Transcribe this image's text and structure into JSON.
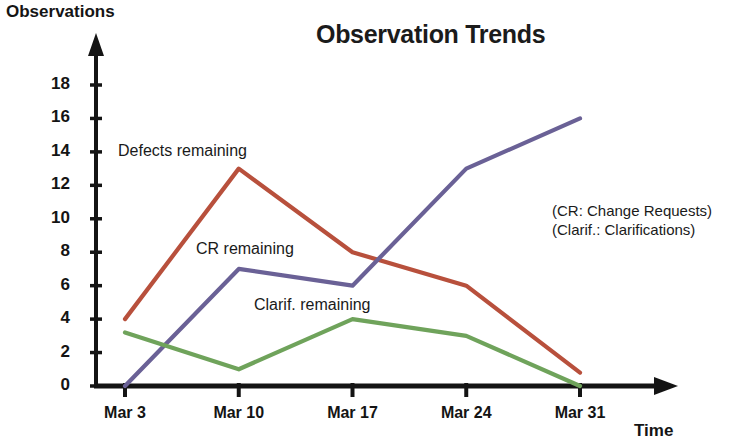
{
  "chart_data": {
    "type": "line",
    "title": "Observation Trends",
    "xlabel": "Time",
    "ylabel": "Observations",
    "categories": [
      "Mar 3",
      "Mar 10",
      "Mar 17",
      "Mar 24",
      "Mar 31"
    ],
    "ylim": [
      0,
      18
    ],
    "y_ticks": [
      "0",
      "2",
      "4",
      "6",
      "8",
      "10",
      "12",
      "14",
      "16",
      "18"
    ],
    "y_tick_values": [
      0,
      2,
      4,
      6,
      8,
      10,
      12,
      14,
      16,
      18
    ],
    "grid": false,
    "legend_position": "inline-labels",
    "series": [
      {
        "name": "Defects remaining",
        "color": "#b8503c",
        "values": [
          4,
          13,
          8,
          6,
          0.8
        ]
      },
      {
        "name": "CR remaining",
        "color": "#6a6196",
        "values": [
          0,
          7,
          6,
          13,
          16
        ]
      },
      {
        "name": "Clarif. remaining",
        "color": "#6fa35b",
        "values": [
          3.2,
          1,
          4,
          3,
          0
        ]
      }
    ],
    "annotations": [
      "(CR: Change Requests)",
      "(Clarif.: Clarifications)"
    ]
  },
  "axis": {
    "y_title": "Observations",
    "x_title": "Time"
  },
  "notes": {
    "line1": "(CR: Change Requests)",
    "line2": "(Clarif.: Clarifications)"
  },
  "series_labels": {
    "defects": "Defects remaining",
    "cr": "CR remaining",
    "clarif": "Clarif. remaining"
  }
}
